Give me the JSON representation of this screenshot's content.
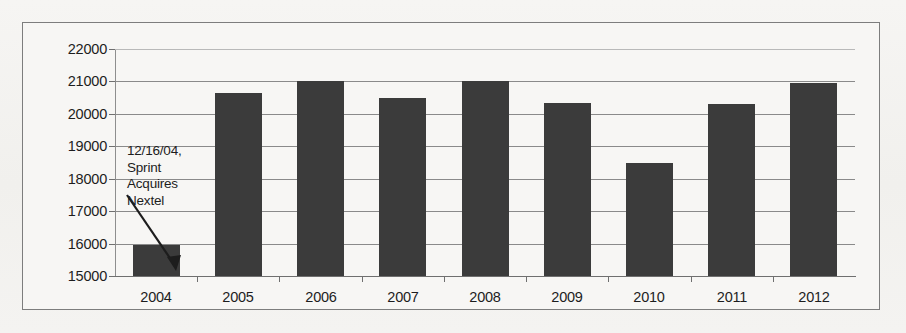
{
  "chart_data": {
    "type": "bar",
    "title": "",
    "subtitle": "",
    "xlabel": "",
    "ylabel": "",
    "categories": [
      "2004",
      "2005",
      "2006",
      "2007",
      "2008",
      "2009",
      "2010",
      "2011",
      "2012"
    ],
    "values": [
      15950,
      20650,
      21000,
      20500,
      21000,
      20350,
      18500,
      20300,
      20950
    ],
    "ylim": [
      15000,
      22000
    ],
    "ytick_labels": [
      "22000",
      "21000",
      "20000",
      "19000",
      "18000",
      "17000",
      "16000",
      "15000"
    ],
    "ytick_values": [
      22000,
      21000,
      20000,
      19000,
      18000,
      17000,
      16000,
      15000
    ],
    "ytick_step": 1000,
    "grid": true,
    "legend": false,
    "legend_position": "none",
    "bar_color": "#3b3b3b",
    "plot_background": "#f7f6f4",
    "gridline_color": "#8a8a8a",
    "axis_color": "#6f6f6f",
    "frame_color": "#7d7d7d",
    "annotations": [
      {
        "text_lines": [
          "12/16/04,",
          "Sprint",
          "Acquires",
          "Nextel"
        ],
        "text": "12/16/04, Sprint Acquires Nextel",
        "points_to_category": "2004",
        "arrow": true
      }
    ]
  }
}
